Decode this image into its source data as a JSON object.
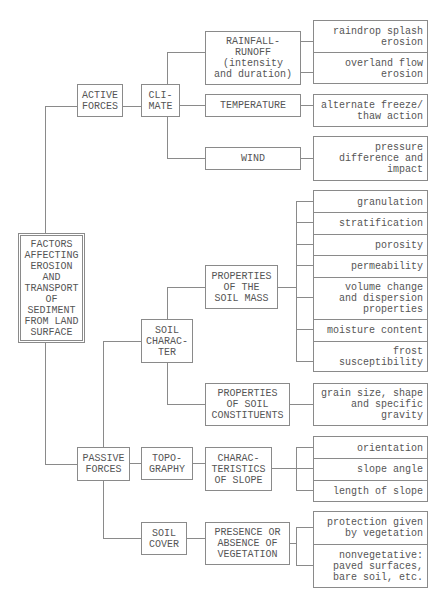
{
  "diagram": {
    "root": "FACTORS\nAFFECTING\nEROSION\nAND\nTRANSPORT\nOF\nSEDIMENT\nFROM LAND\nSURFACE",
    "active_forces": {
      "label": "ACTIVE\nFORCES",
      "climate": {
        "label": "CLI-\nMATE",
        "rainfall": {
          "label": "RAINFALL-\nRUNOFF\n(intensity\nand duration)",
          "effects": [
            "raindrop splash\nerosion",
            "overland flow\nerosion"
          ]
        },
        "temperature": {
          "label": "TEMPERATURE",
          "effects": [
            "alternate freeze/\nthaw action"
          ]
        },
        "wind": {
          "label": "WIND",
          "effects": [
            "pressure\ndifference and\nimpact"
          ]
        }
      }
    },
    "passive_forces": {
      "label": "PASSIVE\nFORCES",
      "soil_character": {
        "label": "SOIL\nCHARAC-\nTER",
        "soil_mass": {
          "label": "PROPERTIES\nOF THE\nSOIL MASS",
          "items": [
            "granulation",
            "stratification",
            "porosity",
            "permeability",
            "volume change\nand dispersion\nproperties",
            "moisture content",
            "frost\nsusceptibility"
          ]
        },
        "soil_constituents": {
          "label": "PROPERTIES\nOF SOIL\nCONSTITUENTS",
          "items": [
            "grain size, shape\nand specific\ngravity"
          ]
        }
      },
      "topography": {
        "label": "TOPO-\nGRAPHY",
        "slope": {
          "label": "CHARAC-\nTERISTICS\nOF SLOPE",
          "items": [
            "orientation",
            "slope angle",
            "length of slope"
          ]
        }
      },
      "soil_cover": {
        "label": "SOIL\nCOVER",
        "vegetation": {
          "label": "PRESENCE OR\nABSENCE OF\nVEGETATION",
          "items": [
            "protection given\nby vegetation",
            "nonvegetative:\npaved surfaces,\nbare soil, etc."
          ]
        }
      }
    }
  }
}
